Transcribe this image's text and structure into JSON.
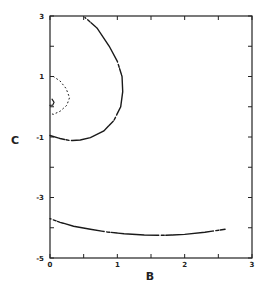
{
  "chart_data": {
    "type": "scatter",
    "title": "",
    "xlabel": "B",
    "ylabel": "C",
    "xlim": [
      0,
      3
    ],
    "ylim": [
      -5,
      3
    ],
    "x_ticks": [
      0,
      1,
      2,
      3
    ],
    "x_tick_labels": [
      "0",
      "1",
      "2",
      "3"
    ],
    "x_minor_ticks": [
      0.5,
      1.5,
      2.5
    ],
    "y_ticks": [
      3,
      1,
      -1,
      -3,
      -5
    ],
    "y_tick_labels": [
      "3",
      "1",
      "-1",
      "-3",
      "-5"
    ],
    "y_minor_ticks": [
      2,
      0,
      -2,
      -4
    ],
    "grid": false,
    "legend": null,
    "series": [
      {
        "name": "large-arc",
        "style": "dotted-to-solid",
        "points": [
          [
            0.52,
            2.95
          ],
          [
            0.7,
            2.6
          ],
          [
            0.88,
            2.0
          ],
          [
            1.0,
            1.5
          ],
          [
            1.07,
            1.0
          ],
          [
            1.08,
            0.5
          ],
          [
            1.05,
            0.0
          ],
          [
            0.95,
            -0.45
          ],
          [
            0.8,
            -0.8
          ],
          [
            0.6,
            -1.02
          ],
          [
            0.45,
            -1.1
          ],
          [
            0.3,
            -1.12
          ],
          [
            0.15,
            -1.05
          ],
          [
            0.0,
            -0.95
          ]
        ]
      },
      {
        "name": "small-arc",
        "style": "dotted",
        "points": [
          [
            0.05,
            1.0
          ],
          [
            0.15,
            0.85
          ],
          [
            0.24,
            0.6
          ],
          [
            0.29,
            0.3
          ],
          [
            0.25,
            0.05
          ],
          [
            0.15,
            -0.15
          ],
          [
            0.05,
            -0.25
          ],
          [
            0.0,
            -0.22
          ]
        ]
      },
      {
        "name": "small-hook",
        "style": "solid",
        "points": [
          [
            0.03,
            0.25
          ],
          [
            0.06,
            0.15
          ],
          [
            0.04,
            0.05
          ],
          [
            0.0,
            0.05
          ]
        ]
      },
      {
        "name": "lower-curve",
        "style": "dotted-to-solid",
        "points": [
          [
            0.0,
            -3.7
          ],
          [
            0.15,
            -3.82
          ],
          [
            0.35,
            -3.95
          ],
          [
            0.6,
            -4.05
          ],
          [
            0.85,
            -4.14
          ],
          [
            1.1,
            -4.2
          ],
          [
            1.4,
            -4.24
          ],
          [
            1.7,
            -4.25
          ],
          [
            2.0,
            -4.22
          ],
          [
            2.3,
            -4.15
          ],
          [
            2.6,
            -4.05
          ]
        ]
      }
    ]
  }
}
